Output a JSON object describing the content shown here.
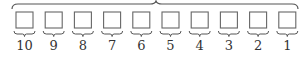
{
  "diagram": {
    "stroke_color": "#666666",
    "box_count": 10,
    "labels": [
      "10",
      "9",
      "8",
      "7",
      "6",
      "5",
      "4",
      "3",
      "2",
      "1"
    ]
  }
}
